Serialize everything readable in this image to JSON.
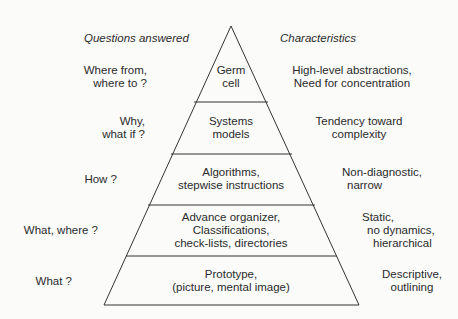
{
  "headers": {
    "left": "Questions answered",
    "right": "Characteristics"
  },
  "levels": [
    {
      "name": "Germ cell",
      "pyramid_lines": [
        "Germ",
        "cell"
      ],
      "question_lines": [
        "Where from,",
        "where to ?"
      ],
      "characteristic_lines": [
        "High-level abstractions,",
        "Need for concentration"
      ]
    },
    {
      "name": "Systems models",
      "pyramid_lines": [
        "Systems",
        "models"
      ],
      "question_lines": [
        "Why,",
        "what if ?"
      ],
      "characteristic_lines": [
        "Tendency toward",
        "complexity"
      ]
    },
    {
      "name": "Algorithms",
      "pyramid_lines": [
        "Algorithms,",
        "stepwise instructions"
      ],
      "question_lines": [
        "How ?"
      ],
      "characteristic_lines": [
        "Non-diagnostic,",
        "narrow"
      ]
    },
    {
      "name": "Advance organizer",
      "pyramid_lines": [
        "Advance organizer,",
        "Classifications,",
        "check-lists, directories"
      ],
      "question_lines": [
        "What, where ?"
      ],
      "characteristic_lines": [
        "Static,",
        "no dynamics,",
        "hierarchical"
      ]
    },
    {
      "name": "Prototype",
      "pyramid_lines": [
        "Prototype,",
        "(picture, mental image)"
      ],
      "question_lines": [
        "What ?"
      ],
      "characteristic_lines": [
        "Descriptive,",
        "outlining"
      ]
    }
  ]
}
